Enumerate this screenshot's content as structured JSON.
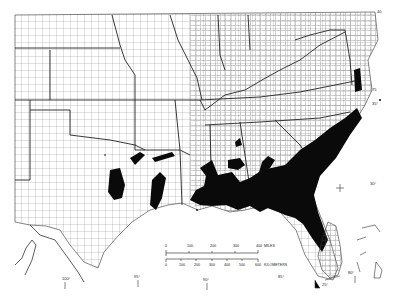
{
  "map": {
    "type": "county-outline distribution map",
    "region": "Southeastern and South-Central United States",
    "fill_color": "#0a0a0a",
    "line_color": "#333333",
    "background": "#ffffff"
  },
  "scale_bar": {
    "miles": {
      "ticks": [
        "0",
        "100",
        "200",
        "300",
        "400"
      ],
      "unit": "MILES"
    },
    "kilometers": {
      "ticks": [
        "0",
        "100",
        "200",
        "300",
        "400",
        "500",
        "600"
      ],
      "unit": "KILOMETERS"
    }
  },
  "graticule_labels": {
    "lon_100": "100°",
    "lon_95": "95°",
    "lon_90": "90°",
    "lon_85": "85°",
    "lat_25": "25°",
    "lon_80": "80°",
    "lat_30": "30°",
    "lat_35": "35°",
    "lon_75": "75",
    "lat_40": "40"
  }
}
